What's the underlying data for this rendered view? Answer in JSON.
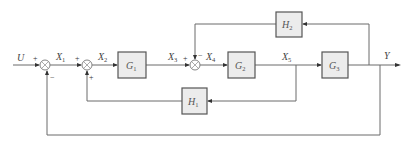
{
  "diagram": {
    "type": "control-system-block-diagram",
    "input": {
      "label": "U"
    },
    "output": {
      "label": "Y"
    },
    "signals": [
      {
        "id": "X1",
        "main": "X",
        "sub": "1"
      },
      {
        "id": "X2",
        "main": "X",
        "sub": "2"
      },
      {
        "id": "X3",
        "main": "X",
        "sub": "3"
      },
      {
        "id": "X4",
        "main": "X",
        "sub": "4"
      },
      {
        "id": "X5",
        "main": "X",
        "sub": "5"
      }
    ],
    "blocks": [
      {
        "id": "G1",
        "main": "G",
        "sub": "1"
      },
      {
        "id": "G2",
        "main": "G",
        "sub": "2"
      },
      {
        "id": "G3",
        "main": "G",
        "sub": "3"
      },
      {
        "id": "H1",
        "main": "H",
        "sub": "1"
      },
      {
        "id": "H2",
        "main": "H",
        "sub": "2"
      }
    ],
    "summing_junctions": [
      {
        "id": "S1",
        "signs": {
          "left": "+",
          "bottom": "−"
        }
      },
      {
        "id": "S2",
        "signs": {
          "left": "+",
          "bottom": "+"
        }
      },
      {
        "id": "S3",
        "signs": {
          "left": "+",
          "top": "−"
        }
      }
    ],
    "connections": [
      "U → S1(+)",
      "S1 → X1 → S2(+)",
      "S2 → X2 → G1",
      "G1 → X3 → S3(+)",
      "S3 → X4 → G2",
      "G2 → X5 → G3",
      "G3 → Y",
      "X5 → H1 → S2(+)",
      "Y → H2 → S3(−)",
      "Y → S1(−)"
    ]
  }
}
